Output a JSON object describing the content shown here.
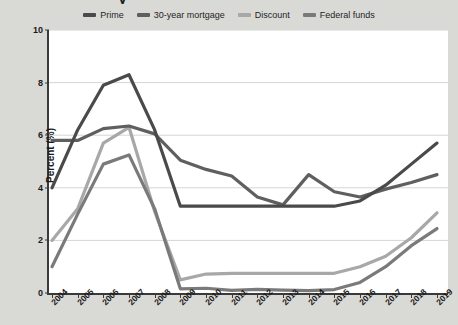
{
  "title_fragment": "y",
  "axis": {
    "ylabel": "Percent (%)",
    "yticks": [
      "0",
      "2",
      "4",
      "6",
      "8",
      "10"
    ],
    "xticks": [
      "2004",
      "2005",
      "2006",
      "2007",
      "2008",
      "2009",
      "2010",
      "2011",
      "2012",
      "2013",
      "2014",
      "2015",
      "2016",
      "2017",
      "2018",
      "2019"
    ]
  },
  "legend": {
    "position": "top-center",
    "items": [
      {
        "label": "Prime",
        "color": "#4a4a4a"
      },
      {
        "label": "30-year mortgage",
        "color": "#5f5f5f"
      },
      {
        "label": "Discount",
        "color": "#a8a8a8"
      },
      {
        "label": "Federal funds",
        "color": "#7a7a7a"
      }
    ]
  },
  "colors": {
    "background": "#d9d9d6",
    "plot_background": "#ffffff",
    "axis": "#3a3a3a",
    "gridline": "#d5d5d5",
    "text": "#1a1a1a"
  },
  "chart_data": {
    "type": "line",
    "title": "",
    "xlabel": "",
    "ylabel": "Percent (%)",
    "ylim": [
      0,
      10
    ],
    "yticks": [
      0,
      2,
      4,
      6,
      8,
      10
    ],
    "grid": true,
    "legend_position": "top-center",
    "x": [
      2004,
      2005,
      2006,
      2007,
      2008,
      2009,
      2010,
      2011,
      2012,
      2013,
      2014,
      2015,
      2016,
      2017,
      2018,
      2019
    ],
    "series": [
      {
        "name": "Prime",
        "color": "#4a4a4a",
        "values": [
          4.0,
          6.2,
          7.9,
          8.3,
          6.2,
          3.3,
          3.3,
          3.3,
          3.3,
          3.3,
          3.3,
          3.3,
          3.5,
          4.1,
          4.9,
          5.7
        ]
      },
      {
        "name": "30-year mortgage",
        "color": "#5f5f5f",
        "values": [
          5.8,
          5.8,
          6.25,
          6.35,
          6.05,
          5.05,
          4.7,
          4.45,
          3.65,
          3.35,
          4.5,
          3.85,
          3.65,
          3.95,
          4.2,
          4.5
        ]
      },
      {
        "name": "Discount",
        "color": "#a8a8a8",
        "values": [
          2.0,
          3.2,
          5.7,
          6.3,
          3.1,
          0.5,
          0.72,
          0.75,
          0.75,
          0.75,
          0.75,
          0.75,
          1.0,
          1.4,
          2.1,
          3.05
        ]
      },
      {
        "name": "Federal funds",
        "color": "#7a7a7a",
        "values": [
          1.0,
          3.0,
          4.9,
          5.25,
          3.2,
          0.16,
          0.18,
          0.1,
          0.14,
          0.11,
          0.09,
          0.13,
          0.4,
          1.0,
          1.8,
          2.45
        ]
      }
    ]
  }
}
